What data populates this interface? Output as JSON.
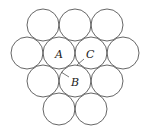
{
  "diagram": {
    "type": "circle-packing",
    "radius": 16,
    "stroke_color": "#555555",
    "circles": [
      {
        "cx": 43,
        "cy": 25
      },
      {
        "cx": 75,
        "cy": 25
      },
      {
        "cx": 107,
        "cy": 25
      },
      {
        "cx": 27,
        "cy": 53
      },
      {
        "cx": 59,
        "cy": 53
      },
      {
        "cx": 91,
        "cy": 53
      },
      {
        "cx": 123,
        "cy": 53
      },
      {
        "cx": 43,
        "cy": 81
      },
      {
        "cx": 75,
        "cy": 81
      },
      {
        "cx": 107,
        "cy": 81
      },
      {
        "cx": 59,
        "cy": 109
      },
      {
        "cx": 91,
        "cy": 109
      }
    ],
    "labels": {
      "a": "A",
      "b": "B",
      "c": "C"
    }
  }
}
